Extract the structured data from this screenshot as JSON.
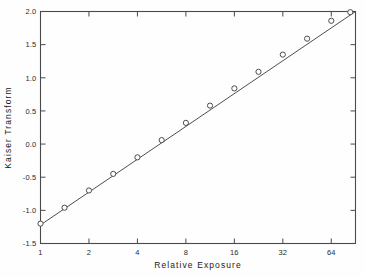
{
  "chart_data": {
    "type": "scatter",
    "title": "",
    "xlabel": "Relative Exposure",
    "ylabel": "Kaiser Transform",
    "xscale": "log2",
    "xlim": [
      1,
      90.5
    ],
    "ylim": [
      -1.5,
      2.0
    ],
    "grid": false,
    "legend": null,
    "x_tick_labels": [
      "1",
      "2",
      "4",
      "8",
      "16",
      "32",
      "64"
    ],
    "x_tick_values": [
      1,
      2,
      4,
      8,
      16,
      32,
      64
    ],
    "y_tick_labels": [
      "2.0",
      "1.5",
      "1.0",
      "0.5",
      "0.0",
      "-0.5",
      "-1.0",
      "-1.5"
    ],
    "y_tick_values": [
      2.0,
      1.5,
      1.0,
      0.5,
      0.0,
      -0.5,
      -1.0,
      -1.5
    ],
    "marker": "open-circle",
    "series": [
      {
        "name": "Kaiser Transform vs Relative Exposure",
        "x": [
          1.0,
          1.41,
          2.0,
          2.83,
          4.0,
          5.66,
          8.0,
          11.3,
          16.0,
          22.6,
          32.0,
          45.3,
          64.0,
          84.0
        ],
        "y": [
          -1.2,
          -0.96,
          -0.7,
          -0.45,
          -0.2,
          0.06,
          0.32,
          0.58,
          0.84,
          1.09,
          1.35,
          1.59,
          1.86,
          1.99
        ]
      }
    ],
    "fit_line": {
      "x_start": 1.0,
      "y_start": -1.22,
      "x_end": 90.5,
      "y_end": 2.0
    }
  }
}
